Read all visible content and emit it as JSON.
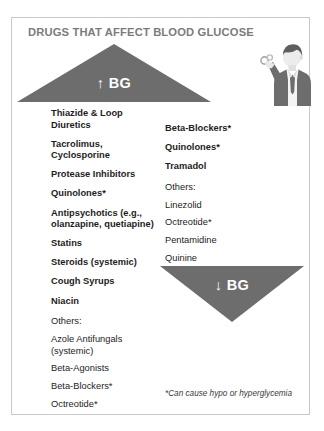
{
  "card": {
    "title": "DRUGS THAT AFFECT BLOOD GLUCOSE",
    "border_color": "#c9c9c9",
    "title_color": "#7b7b7b",
    "background": "#ffffff"
  },
  "triangles": {
    "up": {
      "label": "↑ BG",
      "arrow": "↑",
      "text": "BG",
      "color": "#6d6d6d",
      "text_color": "#ffffff",
      "direction": "up"
    },
    "down": {
      "label": "↓ BG",
      "arrow": "↓",
      "text": "BG",
      "color": "#6d6d6d",
      "text_color": "#ffffff",
      "direction": "down"
    }
  },
  "increase_bg_drugs": {
    "primary": [
      "Thiazide & Loop Diuretics",
      "Tacrolimus, Cyclosporine",
      "Protease Inhibitors",
      "Quinolones*",
      "Antipsychotics (e.g., olanzapine, quetiapine)",
      "Statins",
      "Steroids (systemic)",
      "Cough Syrups",
      "Niacin"
    ],
    "others_heading": "Others:",
    "others": [
      "Azole Antifungals (systemic)",
      "Beta-Agonists",
      "Beta-Blockers*",
      "Octreotide*"
    ]
  },
  "decrease_bg_drugs": {
    "primary": [
      "Beta-Blockers*",
      "Quinolones*",
      "Tramadol"
    ],
    "others_heading": "Others:",
    "others": [
      "Linezolid",
      "Octreotide*",
      "Pentamidine",
      "Quinine"
    ]
  },
  "footnote": "*Can cause hypo or hyperglycemia",
  "illustration": {
    "name": "person-holding-pill",
    "suit_color": "#6d6d6d",
    "hair_color": "#5e5e5e",
    "skin_color": "#e8e8e8",
    "shirt_color": "#f2f2f2"
  }
}
